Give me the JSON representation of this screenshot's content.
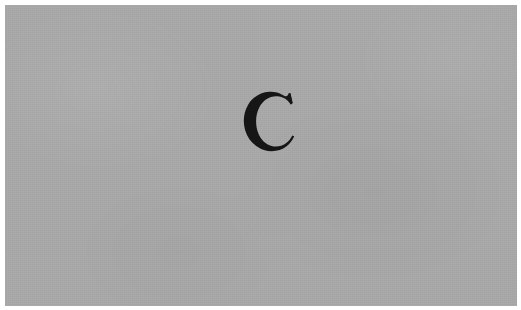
{
  "page": {
    "background_color": "#ffffff",
    "width": 521,
    "height": 310
  },
  "scan": {
    "name": "scanned-paper-field",
    "background_color": "#a9a9a9",
    "inset_left": 5,
    "inset_top": 5,
    "inset_right": 4,
    "inset_bottom": 4
  },
  "glyph": {
    "character": "C",
    "description": "large serif capital letter C",
    "style": "high-contrast didone serif",
    "ink_color": "#161616",
    "left": 238,
    "top": 96,
    "width": 54,
    "height": 56,
    "center_x": 265,
    "center_y": 124
  }
}
